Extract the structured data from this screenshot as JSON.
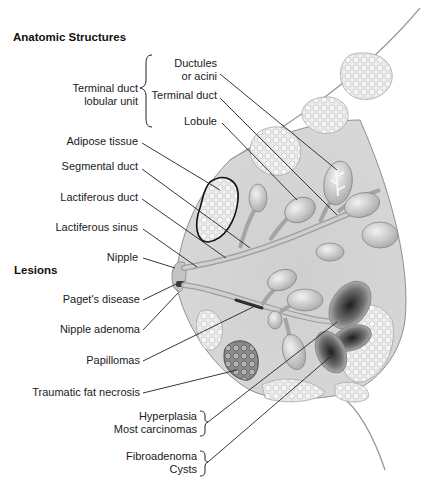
{
  "sections": {
    "anatomic": "Anatomic Structures",
    "lesions": "Lesions"
  },
  "anatomic_structures": {
    "group_label_line1": "Terminal duct",
    "group_label_line2": "lobular unit",
    "group_items": [
      {
        "line1": "Ductules",
        "line2": "or acini"
      },
      {
        "line1": "Terminal duct"
      },
      {
        "line1": "Lobule"
      }
    ],
    "items": [
      "Adipose tissue",
      "Segmental duct",
      "Lactiferous duct",
      "Lactiferous sinus",
      "Nipple"
    ]
  },
  "lesions": {
    "items": [
      "Paget's disease",
      "Nipple adenoma",
      "Papillomas",
      "Traumatic fat necrosis"
    ],
    "grouped": [
      {
        "line1": "Hyperplasia",
        "line2": "Most carcinomas"
      },
      {
        "line1": "Fibroadenoma",
        "line2": "Cysts"
      }
    ]
  },
  "colors": {
    "tissue": "#d4d4d4",
    "adipose": "#e6e6e6",
    "duct": "#bdbdbd",
    "lesion_dark": "#3a3a3a",
    "outline": "#8a8a8a",
    "leader": "#222222"
  }
}
